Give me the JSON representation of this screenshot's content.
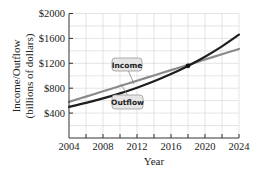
{
  "chart_data": {
    "type": "line",
    "title": "",
    "xlabel": "Year",
    "ylabel": "Income/Outflow (billions of dollars)",
    "ylabel_lines": [
      "Income/Outflow",
      "(billions of dollars)"
    ],
    "xlim": [
      2004,
      2024
    ],
    "ylim": [
      0,
      2000
    ],
    "x_ticks": [
      2004,
      2008,
      2012,
      2016,
      2020,
      2024
    ],
    "x_minor_ticks_every": 2,
    "y_ticks": [
      400,
      800,
      1200,
      1600,
      2000
    ],
    "y_tick_labels": [
      "$400",
      "$800",
      "$1200",
      "$1600",
      "$2000"
    ],
    "grid": true,
    "x": [
      2004,
      2006,
      2008,
      2010,
      2012,
      2014,
      2016,
      2018,
      2020,
      2022,
      2024
    ],
    "series": [
      {
        "name": "Income",
        "color": "#8a8a8a",
        "values": [
          580,
          665,
          750,
          835,
          920,
          1005,
          1090,
          1175,
          1260,
          1345,
          1430
        ]
      },
      {
        "name": "Outflow",
        "color": "#1e1e1e",
        "values": [
          500,
          564,
          636,
          717,
          808,
          911,
          1027,
          1158,
          1306,
          1472,
          1660
        ]
      }
    ],
    "annotations": [
      {
        "type": "point",
        "label": "intersection",
        "x": 2018,
        "y": 1160
      },
      {
        "type": "callout",
        "text": "Income",
        "series": "Income"
      },
      {
        "type": "callout",
        "text": "Outflow",
        "series": "Outflow"
      }
    ],
    "legend": "callout labels on lines"
  },
  "labels": {
    "income": "Income",
    "outflow": "Outflow",
    "xlabel": "Year",
    "ylabel_line1": "Income/Outflow",
    "ylabel_line2": "(billions of dollars)"
  },
  "colors": {
    "grid": "#d9d9d9",
    "axis": "#333333",
    "callout_fill": "#e6e6e6",
    "callout_stroke": "#9a9a9a"
  }
}
